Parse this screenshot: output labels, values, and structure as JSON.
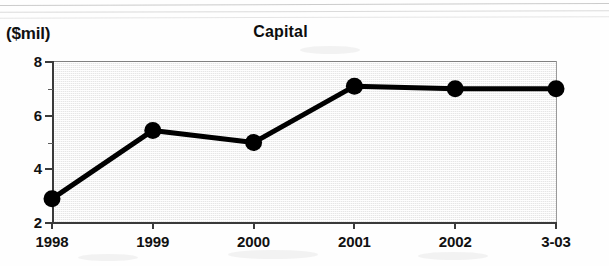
{
  "chart_data": {
    "type": "line",
    "title": "Capital",
    "xlabel": "",
    "ylabel": "($mil)",
    "categories": [
      "1998",
      "1999",
      "2000",
      "2001",
      "2002",
      "3-03"
    ],
    "values": [
      2.9,
      5.45,
      5.0,
      7.1,
      7.0,
      7.0
    ],
    "series": [
      {
        "name": "Capital",
        "values": [
          2.9,
          5.45,
          5.0,
          7.1,
          7.0,
          7.0
        ]
      }
    ],
    "ylim": [
      2,
      8
    ],
    "yticks": [
      "8",
      "6",
      "4",
      "2"
    ],
    "ytick_values": [
      8,
      6,
      4,
      2
    ],
    "y_minor_ticks": [
      7,
      5,
      3
    ],
    "grid": false,
    "legend": "none",
    "marker": "filled-circle",
    "line_color": "#000000",
    "plot_background": "#e0e0e0"
  },
  "axis": {
    "unit_label": "($mil)"
  }
}
